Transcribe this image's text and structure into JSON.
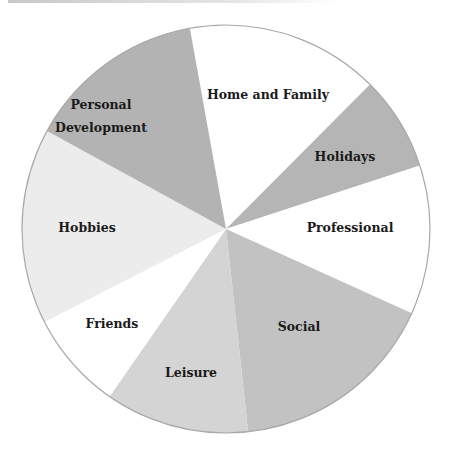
{
  "chart_data": {
    "type": "pie",
    "title": "",
    "start_angle_deg": 349.8,
    "direction": "clockwise",
    "center": [
      226,
      229
    ],
    "radius": 204,
    "categories": [
      "Home and Family",
      "Holidays",
      "Professional",
      "Social",
      "Leisure",
      "Friends",
      "Hobbies",
      "Personal Development"
    ],
    "values": [
      15.3,
      7.5,
      11.8,
      16.5,
      11.4,
      7.8,
      15.5,
      14.2
    ],
    "colors": [
      "#ffffff",
      "#b5b5b5",
      "#ffffff",
      "#c2c2c2",
      "#d4d4d4",
      "#ffffff",
      "#ececec",
      "#b3b3b3"
    ],
    "labels": [
      {
        "lines": [
          "Home and Family"
        ],
        "x": 268,
        "y": 99
      },
      {
        "lines": [
          "Holidays"
        ],
        "x": 345,
        "y": 161
      },
      {
        "lines": [
          "Professional"
        ],
        "x": 350,
        "y": 232
      },
      {
        "lines": [
          "Social"
        ],
        "x": 299,
        "y": 331
      },
      {
        "lines": [
          "Leisure"
        ],
        "x": 191,
        "y": 377
      },
      {
        "lines": [
          "Friends"
        ],
        "x": 112,
        "y": 328
      },
      {
        "lines": [
          "Hobbies"
        ],
        "x": 87,
        "y": 232
      },
      {
        "lines": [
          "Personal",
          "Development"
        ],
        "x": 101,
        "y": 109
      }
    ],
    "legend": null,
    "outline_color": "#a8a8a8"
  }
}
